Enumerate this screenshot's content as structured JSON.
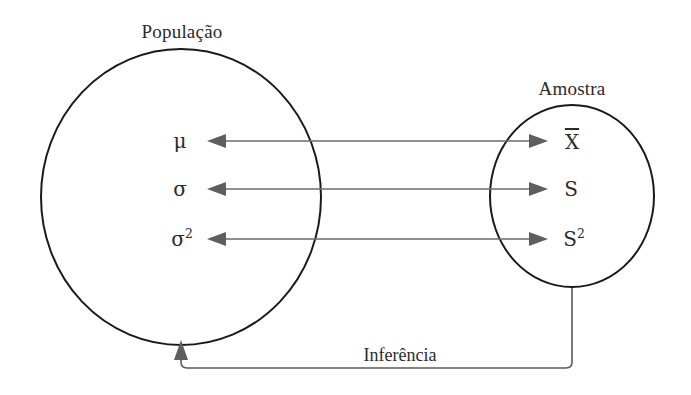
{
  "diagram": {
    "title_population": "População",
    "title_sample": "Amostra",
    "inference_label": "Inferência",
    "colors": {
      "ellipse_stroke": "#1a1a1a",
      "arrow_stroke": "#6b6b6b",
      "arrow_head": "#5e5e5e",
      "inference_stroke": "#5a5a5a",
      "text": "#2b2b2b",
      "background": "#ffffff"
    },
    "population": {
      "label": "População",
      "parameters": [
        {
          "symbol": "μ",
          "exponent": "",
          "name": "mu",
          "meaning": "population mean"
        },
        {
          "symbol": "σ",
          "exponent": "",
          "name": "sigma",
          "meaning": "population standard deviation"
        },
        {
          "symbol": "σ",
          "exponent": "2",
          "name": "sigma-squared",
          "meaning": "population variance"
        }
      ]
    },
    "sample": {
      "label": "Amostra",
      "statistics": [
        {
          "symbol": "X",
          "overline": true,
          "exponent": "",
          "name": "x-bar",
          "meaning": "sample mean"
        },
        {
          "symbol": "S",
          "overline": false,
          "exponent": "",
          "name": "s",
          "meaning": "sample standard deviation"
        },
        {
          "symbol": "S",
          "overline": false,
          "exponent": "2",
          "name": "s-squared",
          "meaning": "sample variance"
        }
      ]
    },
    "connectors": [
      {
        "name": "estimation-arrow-mean",
        "row": 1,
        "double_headed": true
      },
      {
        "name": "estimation-arrow-sd",
        "row": 2,
        "double_headed": true
      },
      {
        "name": "estimation-arrow-variance",
        "row": 3,
        "double_headed": true
      },
      {
        "name": "inference-path",
        "double_headed": false,
        "direction": "sample-to-population"
      }
    ]
  }
}
